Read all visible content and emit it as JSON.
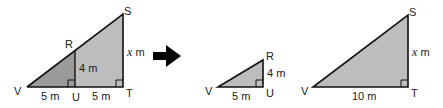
{
  "colors": {
    "fill_dark": "#9a9a9a",
    "fill_light": "#bdbdbd",
    "stroke": "#111111",
    "arrow": "#000000"
  },
  "figure1": {
    "vertices": {
      "V": "V",
      "R": "R",
      "S": "S",
      "U": "U",
      "T": "T"
    },
    "labels": {
      "VU": "5 m",
      "UT": "5 m",
      "RU": "4 m",
      "ST_var": "x",
      "ST_unit": " m"
    }
  },
  "figure2": {
    "vertices": {
      "V": "V",
      "R": "R",
      "U": "U"
    },
    "labels": {
      "VU": "5 m",
      "RU": "4 m"
    }
  },
  "figure3": {
    "vertices": {
      "V": "V",
      "S": "S",
      "T": "T"
    },
    "labels": {
      "VT": "10 m",
      "ST_var": "x",
      "ST_unit": " m"
    }
  }
}
